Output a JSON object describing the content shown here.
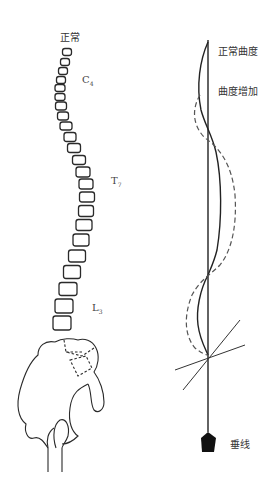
{
  "spine_diagram": {
    "top_label": "正常",
    "level_labels": [
      {
        "letter": "C",
        "sub": "4",
        "x": 82,
        "y": 80
      },
      {
        "letter": "T",
        "sub": "7",
        "x": 111,
        "y": 181
      },
      {
        "letter": "L",
        "sub": "3",
        "x": 92,
        "y": 308
      }
    ],
    "vertebrae": [
      {
        "cx": 67,
        "cy": 52,
        "w": 9,
        "h": 7
      },
      {
        "cx": 65,
        "cy": 62,
        "w": 9,
        "h": 7
      },
      {
        "cx": 63,
        "cy": 71,
        "w": 9,
        "h": 7
      },
      {
        "cx": 61,
        "cy": 80,
        "w": 9,
        "h": 7
      },
      {
        "cx": 60,
        "cy": 88,
        "w": 10,
        "h": 7
      },
      {
        "cx": 60,
        "cy": 97,
        "w": 10,
        "h": 7
      },
      {
        "cx": 61,
        "cy": 106,
        "w": 11,
        "h": 8
      },
      {
        "cx": 63,
        "cy": 116,
        "w": 11,
        "h": 8
      },
      {
        "cx": 66,
        "cy": 126,
        "w": 12,
        "h": 8
      },
      {
        "cx": 70,
        "cy": 137,
        "w": 12,
        "h": 9
      },
      {
        "cx": 74,
        "cy": 148,
        "w": 13,
        "h": 9
      },
      {
        "cx": 79,
        "cy": 160,
        "w": 13,
        "h": 9
      },
      {
        "cx": 83,
        "cy": 172,
        "w": 14,
        "h": 10
      },
      {
        "cx": 86,
        "cy": 184,
        "w": 14,
        "h": 10
      },
      {
        "cx": 87,
        "cy": 197,
        "w": 15,
        "h": 10
      },
      {
        "cx": 86,
        "cy": 211,
        "w": 15,
        "h": 11
      },
      {
        "cx": 84,
        "cy": 225,
        "w": 16,
        "h": 11
      },
      {
        "cx": 81,
        "cy": 240,
        "w": 16,
        "h": 12
      },
      {
        "cx": 77,
        "cy": 256,
        "w": 17,
        "h": 12
      },
      {
        "cx": 72,
        "cy": 272,
        "w": 17,
        "h": 13
      },
      {
        "cx": 68,
        "cy": 289,
        "w": 18,
        "h": 13
      },
      {
        "cx": 64,
        "cy": 306,
        "w": 18,
        "h": 14
      },
      {
        "cx": 62,
        "cy": 323,
        "w": 18,
        "h": 14
      }
    ]
  },
  "curve_diagram": {
    "label_normal": "正常曲度",
    "label_increased": "曲度增加",
    "label_plumb": "垂线",
    "plumb_line_x": 208,
    "plumb_line_top": 40,
    "plumb_line_bottom": 432
  },
  "colors": {
    "line": "#222222",
    "dashed": "#555555",
    "background": "#ffffff"
  }
}
